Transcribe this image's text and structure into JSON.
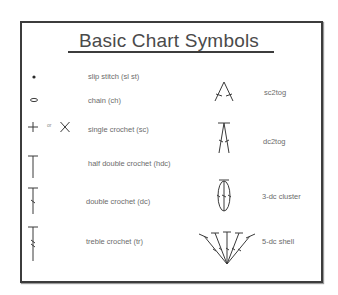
{
  "title": "Basic Chart Symbols",
  "left_column": [
    {
      "icon": "slip-stitch-dot",
      "label": "slip stitch  (sl st)"
    },
    {
      "icon": "chain-oval",
      "label": "chain (ch)"
    },
    {
      "icon": "single-crochet-plus-or-x",
      "label": "single crochet (sc)",
      "or_text": "or"
    },
    {
      "icon": "half-double-crochet-t",
      "label": "half double crochet (hdc)"
    },
    {
      "icon": "double-crochet-t-slash",
      "label": "double crochet (dc)"
    },
    {
      "icon": "treble-crochet-t-double-slash",
      "label": "treble crochet (tr)"
    }
  ],
  "right_column": [
    {
      "icon": "sc2tog",
      "label": "sc2tog"
    },
    {
      "icon": "dc2tog",
      "label": "dc2tog"
    },
    {
      "icon": "three-dc-cluster",
      "label": "3-dc cluster"
    },
    {
      "icon": "five-dc-shell",
      "label": "5-dc shell"
    }
  ]
}
